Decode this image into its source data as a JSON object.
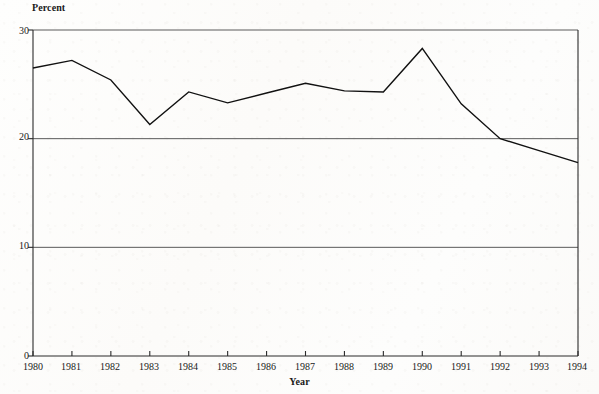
{
  "chart_data": {
    "type": "line",
    "title": "",
    "subtitle": "",
    "xlabel": "Year",
    "ylabel": "Percent",
    "categories": [
      "1980",
      "1981",
      "1982",
      "1983",
      "1984",
      "1985",
      "1986",
      "1987",
      "1988",
      "1989",
      "1990",
      "1991",
      "1992",
      "1993",
      "1994"
    ],
    "x": [
      1980,
      1981,
      1982,
      1983,
      1984,
      1985,
      1986,
      1987,
      1988,
      1989,
      1990,
      1991,
      1992,
      1993,
      1994
    ],
    "values": [
      26.5,
      27.2,
      25.4,
      21.3,
      24.3,
      23.3,
      24.2,
      25.1,
      24.4,
      24.3,
      28.3,
      23.2,
      20.0,
      18.9,
      17.8
    ],
    "series": [
      {
        "name": "Percent",
        "values": [
          26.5,
          27.2,
          25.4,
          21.3,
          24.3,
          23.3,
          24.2,
          25.1,
          24.4,
          24.3,
          28.3,
          23.2,
          20.0,
          18.9,
          17.8
        ]
      }
    ],
    "ylim": [
      0,
      30
    ],
    "xlim": [
      1980,
      1994
    ],
    "yticks": [
      0,
      10,
      20,
      30
    ],
    "ytick_labels": [
      "0",
      "10",
      "20",
      "30"
    ],
    "xtick_labels": [
      "1980",
      "1981",
      "1982",
      "1983",
      "1984",
      "1985",
      "1986",
      "1987",
      "1988",
      "1989",
      "1990",
      "1991",
      "1992",
      "1993",
      "1994"
    ],
    "grid": true,
    "gridlines_y": [
      10,
      20,
      30
    ],
    "legend": false,
    "legend_position": "none",
    "line_color": "#111111",
    "line_width": 1.4,
    "markers": false,
    "annotations": []
  },
  "axes": {
    "y_title": "Percent",
    "x_title": "Year"
  },
  "colors": {
    "background": "#fdfcfa",
    "axis": "#2b2b2b",
    "grid": "#5a5a5a",
    "line": "#111111",
    "text": "#1a1a1a"
  }
}
